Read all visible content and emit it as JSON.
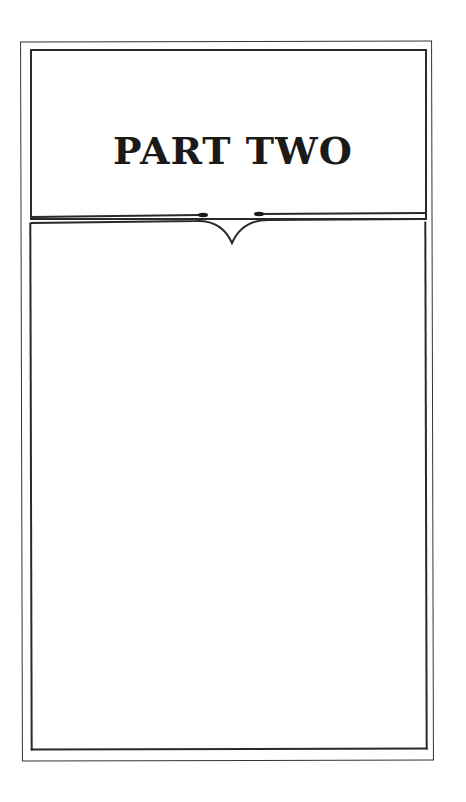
{
  "page": {
    "title": "PART TWO"
  },
  "colors": {
    "ink": "#1a1a1a",
    "background": "#ffffff"
  }
}
